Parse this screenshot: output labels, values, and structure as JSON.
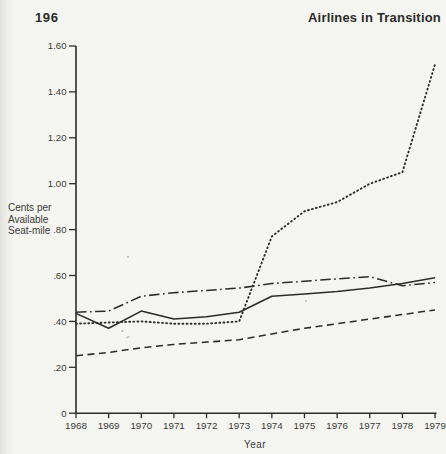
{
  "page": {
    "page_number": "196",
    "running_head": "Airlines in Transition"
  },
  "colors": {
    "ink": "#2c2c29",
    "text": "#3a3a36",
    "paper": "#f5f5f2"
  },
  "chart_data": {
    "type": "line",
    "x": [
      1968,
      1969,
      1970,
      1971,
      1972,
      1973,
      1974,
      1975,
      1976,
      1977,
      1978,
      1979
    ],
    "xtick_labels": [
      "1968",
      "1969",
      "1970",
      "1971",
      "1972",
      "1973",
      "1974",
      "1975",
      "1976",
      "1977",
      "1978",
      "1979"
    ],
    "xlabel": "Year",
    "ylabel_lines": [
      "Cents per",
      "Available",
      "Seat-mile"
    ],
    "ylabel": "Cents per Available Seat-mile",
    "ylim": [
      0,
      1.6
    ],
    "ytick_values": [
      0,
      0.2,
      0.4,
      0.6,
      0.8,
      1.0,
      1.2,
      1.4,
      1.6
    ],
    "ytick_labels": [
      "0",
      ".20",
      ".40",
      ".60",
      ".80",
      "1.00",
      "1.20",
      "1.40",
      "1.60"
    ],
    "grid": false,
    "legend": "none",
    "series": [
      {
        "name": "dotted-line",
        "style": "dotted",
        "values": [
          0.39,
          0.395,
          0.4,
          0.39,
          0.39,
          0.4,
          0.77,
          0.88,
          0.92,
          1.0,
          1.05,
          1.52
        ]
      },
      {
        "name": "dash-dot-line",
        "style": "dash-dot",
        "values": [
          0.44,
          0.445,
          0.51,
          0.525,
          0.535,
          0.545,
          0.565,
          0.575,
          0.585,
          0.595,
          0.555,
          0.57
        ]
      },
      {
        "name": "solid-line",
        "style": "solid",
        "values": [
          0.435,
          0.37,
          0.445,
          0.41,
          0.42,
          0.44,
          0.51,
          0.52,
          0.53,
          0.545,
          0.565,
          0.59
        ]
      },
      {
        "name": "dashed-line",
        "style": "dashed",
        "values": [
          0.25,
          0.265,
          0.285,
          0.3,
          0.31,
          0.32,
          0.345,
          0.37,
          0.39,
          0.41,
          0.43,
          0.45
        ]
      }
    ]
  }
}
